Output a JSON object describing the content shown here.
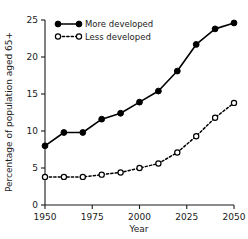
{
  "chart_data": {
    "type": "line",
    "title": "",
    "xlabel": "Year",
    "ylabel": "Percentage of population aged 65+",
    "x": [
      1950,
      1960,
      1970,
      1980,
      1990,
      2000,
      2010,
      2020,
      2030,
      2040,
      2050
    ],
    "xlim": [
      1950,
      2050
    ],
    "ylim": [
      0,
      25
    ],
    "xticks": [
      1950,
      1975,
      2000,
      2025,
      2050
    ],
    "xtick_labels": [
      "1950",
      "1975",
      "2000",
      "2025",
      "2050"
    ],
    "yticks": [
      0,
      5,
      10,
      15,
      20,
      25
    ],
    "ytick_labels": [
      "0",
      "5",
      "10",
      "15",
      "20",
      "25"
    ],
    "grid": false,
    "legend_position": "top-left",
    "series": [
      {
        "name": "More developed",
        "marker": "filled-circle",
        "linestyle": "solid",
        "color": "#000000",
        "values": [
          8.0,
          9.8,
          9.8,
          11.6,
          12.4,
          13.9,
          15.4,
          18.1,
          21.7,
          23.8,
          24.6
        ]
      },
      {
        "name": "Less developed",
        "marker": "open-circle",
        "linestyle": "dashed",
        "color": "#000000",
        "values": [
          3.8,
          3.8,
          3.8,
          4.1,
          4.4,
          5.0,
          5.6,
          7.1,
          9.3,
          11.8,
          13.8
        ]
      }
    ]
  },
  "legend": {
    "entries": [
      {
        "label": "More developed"
      },
      {
        "label": "Less developed"
      }
    ]
  },
  "axes": {
    "x_title": "Year",
    "y_title": "Percentage of population aged 65+"
  }
}
